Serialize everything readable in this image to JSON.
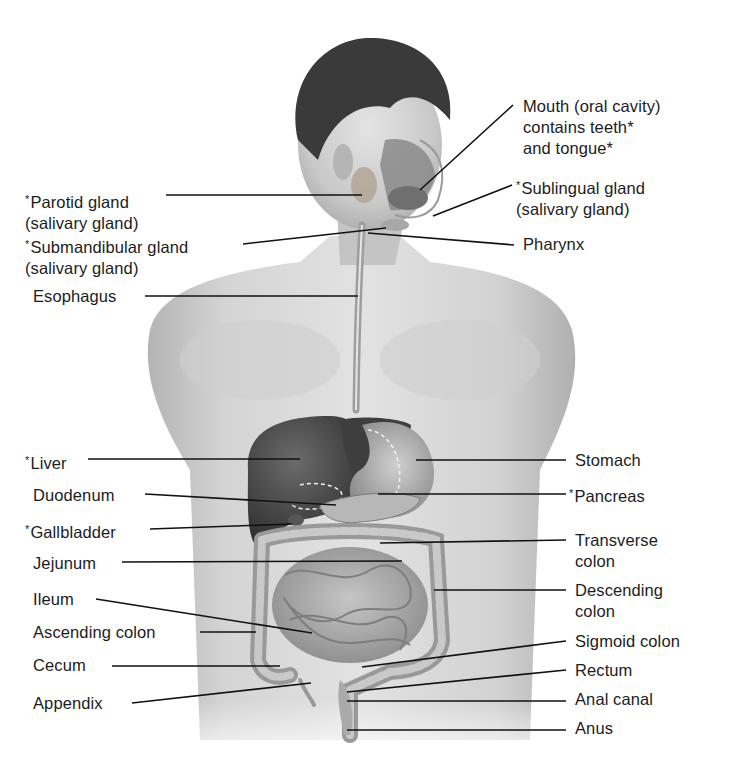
{
  "diagram": {
    "footnote_marker": "*",
    "colors": {
      "background": "#ffffff",
      "text": "#1c1c1c",
      "leader_line": "#111111",
      "skin": "#c9c9c9",
      "hair": "#3a3a3a",
      "liver": "#4a4a4a",
      "intestine": "#a8a8a8"
    },
    "labels": [
      {
        "id": "mouth",
        "lines": [
          "Mouth (oral cavity)",
          "contains teeth*",
          "and tongue*"
        ],
        "accessory": false,
        "side": "right",
        "x": 523,
        "y": 96
      },
      {
        "id": "parotid-gland",
        "lines": [
          "Parotid gland",
          "(salivary gland)"
        ],
        "accessory": true,
        "side": "left",
        "x": 25,
        "y": 189
      },
      {
        "id": "sublingual-gland",
        "lines": [
          "Sublingual gland",
          "(salivary gland)"
        ],
        "accessory": true,
        "side": "right",
        "x": 516,
        "y": 175
      },
      {
        "id": "submandibular-gland",
        "lines": [
          "Submandibular gland",
          "(salivary gland)"
        ],
        "accessory": true,
        "side": "left",
        "x": 25,
        "y": 234
      },
      {
        "id": "pharynx",
        "lines": [
          "Pharynx"
        ],
        "accessory": false,
        "side": "right",
        "x": 523,
        "y": 234
      },
      {
        "id": "esophagus",
        "lines": [
          "Esophagus"
        ],
        "accessory": false,
        "side": "left",
        "x": 33,
        "y": 286
      },
      {
        "id": "liver",
        "lines": [
          "Liver"
        ],
        "accessory": true,
        "side": "left",
        "x": 25,
        "y": 450
      },
      {
        "id": "stomach",
        "lines": [
          "Stomach"
        ],
        "accessory": false,
        "side": "right",
        "x": 575,
        "y": 450
      },
      {
        "id": "duodenum",
        "lines": [
          "Duodenum"
        ],
        "accessory": false,
        "side": "left",
        "x": 33,
        "y": 485
      },
      {
        "id": "pancreas",
        "lines": [
          "Pancreas"
        ],
        "accessory": true,
        "side": "right",
        "x": 569,
        "y": 483
      },
      {
        "id": "gallbladder",
        "lines": [
          "Gallbladder"
        ],
        "accessory": true,
        "side": "left",
        "x": 25,
        "y": 519
      },
      {
        "id": "transverse-colon",
        "lines": [
          "Transverse",
          "colon"
        ],
        "accessory": false,
        "side": "right",
        "x": 575,
        "y": 530
      },
      {
        "id": "jejunum",
        "lines": [
          "Jejunum"
        ],
        "accessory": false,
        "side": "left",
        "x": 33,
        "y": 553
      },
      {
        "id": "descending-colon",
        "lines": [
          "Descending",
          "colon"
        ],
        "accessory": false,
        "side": "right",
        "x": 575,
        "y": 580
      },
      {
        "id": "ileum",
        "lines": [
          "Ileum"
        ],
        "accessory": false,
        "side": "left",
        "x": 33,
        "y": 589
      },
      {
        "id": "ascending-colon",
        "lines": [
          "Ascending colon"
        ],
        "accessory": false,
        "side": "left",
        "x": 33,
        "y": 622
      },
      {
        "id": "sigmoid-colon",
        "lines": [
          "Sigmoid colon"
        ],
        "accessory": false,
        "side": "right",
        "x": 575,
        "y": 631
      },
      {
        "id": "cecum",
        "lines": [
          "Cecum"
        ],
        "accessory": false,
        "side": "left",
        "x": 33,
        "y": 655
      },
      {
        "id": "rectum",
        "lines": [
          "Rectum"
        ],
        "accessory": false,
        "side": "right",
        "x": 575,
        "y": 660
      },
      {
        "id": "anal-canal",
        "lines": [
          "Anal canal"
        ],
        "accessory": false,
        "side": "right",
        "x": 575,
        "y": 689
      },
      {
        "id": "appendix",
        "lines": [
          "Appendix"
        ],
        "accessory": false,
        "side": "left",
        "x": 33,
        "y": 693
      },
      {
        "id": "anus",
        "lines": [
          "Anus"
        ],
        "accessory": false,
        "side": "right",
        "x": 575,
        "y": 718
      }
    ],
    "leader_lines": [
      {
        "id": "mouth",
        "x1": 513,
        "y1": 105,
        "x2": 420,
        "y2": 190
      },
      {
        "id": "parotid-gland",
        "x1": 166,
        "y1": 195,
        "x2": 362,
        "y2": 195
      },
      {
        "id": "sublingual-gland",
        "x1": 512,
        "y1": 185,
        "x2": 433,
        "y2": 216
      },
      {
        "id": "submandibular-gland",
        "x1": 243,
        "y1": 244,
        "x2": 386,
        "y2": 228
      },
      {
        "id": "pharynx",
        "x1": 514,
        "y1": 245,
        "x2": 368,
        "y2": 233
      },
      {
        "id": "esophagus",
        "x1": 145,
        "y1": 296,
        "x2": 358,
        "y2": 296
      },
      {
        "id": "liver",
        "x1": 88,
        "y1": 459,
        "x2": 300,
        "y2": 459
      },
      {
        "id": "stomach",
        "x1": 566,
        "y1": 460,
        "x2": 416,
        "y2": 460
      },
      {
        "id": "duodenum",
        "x1": 145,
        "y1": 494,
        "x2": 336,
        "y2": 505
      },
      {
        "id": "pancreas",
        "x1": 566,
        "y1": 494,
        "x2": 378,
        "y2": 494
      },
      {
        "id": "gallbladder",
        "x1": 150,
        "y1": 529,
        "x2": 292,
        "y2": 524
      },
      {
        "id": "transverse-colon",
        "x1": 566,
        "y1": 540,
        "x2": 380,
        "y2": 543
      },
      {
        "id": "jejunum",
        "x1": 122,
        "y1": 562,
        "x2": 402,
        "y2": 561
      },
      {
        "id": "descending-colon",
        "x1": 566,
        "y1": 590,
        "x2": 434,
        "y2": 590
      },
      {
        "id": "ileum",
        "x1": 96,
        "y1": 599,
        "x2": 312,
        "y2": 633
      },
      {
        "id": "ascending-colon",
        "x1": 200,
        "y1": 632,
        "x2": 256,
        "y2": 632
      },
      {
        "id": "sigmoid-colon",
        "x1": 566,
        "y1": 641,
        "x2": 362,
        "y2": 667
      },
      {
        "id": "cecum",
        "x1": 112,
        "y1": 666,
        "x2": 280,
        "y2": 666
      },
      {
        "id": "rectum",
        "x1": 566,
        "y1": 670,
        "x2": 347,
        "y2": 692
      },
      {
        "id": "anal-canal",
        "x1": 566,
        "y1": 701,
        "x2": 347,
        "y2": 701
      },
      {
        "id": "appendix",
        "x1": 132,
        "y1": 703,
        "x2": 311,
        "y2": 683
      },
      {
        "id": "anus",
        "x1": 566,
        "y1": 730,
        "x2": 347,
        "y2": 730
      }
    ]
  }
}
